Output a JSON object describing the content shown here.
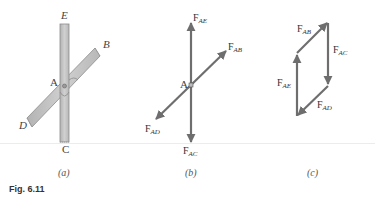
{
  "figure": {
    "label": "Fig. 6.11",
    "panels": [
      {
        "id": "a",
        "caption": "(a)",
        "description": "Two bars crossing at joint A",
        "point_labels": {
          "E": "E",
          "B": "B",
          "A": "A",
          "D": "D",
          "C": "C"
        }
      },
      {
        "id": "b",
        "caption": "(b)",
        "description": "Free-body diagram of forces at joint A",
        "point_label": "A",
        "forces": [
          {
            "main": "F",
            "sub": "AE"
          },
          {
            "main": "F",
            "sub": "AB"
          },
          {
            "main": "F",
            "sub": "AD"
          },
          {
            "main": "F",
            "sub": "AC"
          }
        ]
      },
      {
        "id": "c",
        "caption": "(c)",
        "description": "Force polygon (parallelogram)",
        "forces": [
          {
            "main": "F",
            "sub": "AB"
          },
          {
            "main": "F",
            "sub": "AC"
          },
          {
            "main": "F",
            "sub": "AE"
          },
          {
            "main": "F",
            "sub": "AD"
          }
        ]
      }
    ],
    "colors": {
      "bar_fill": "#c4c4c4",
      "bar_stroke": "#8c8c8c",
      "arrow": "#6e6e6e"
    }
  }
}
